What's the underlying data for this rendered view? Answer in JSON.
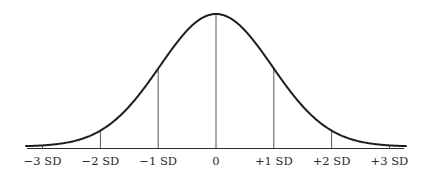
{
  "chart_data": {
    "type": "line",
    "title": "",
    "xlabel": "",
    "ylabel": "",
    "x_ticks": [
      -3,
      -2,
      -1,
      0,
      1,
      2,
      3
    ],
    "tick_labels": [
      "−3 SD",
      "−2 SD",
      "−1 SD",
      "0",
      "+1 SD",
      "+2 SD",
      "+3 SD"
    ],
    "series": [
      {
        "name": "normal density",
        "x": [
          -3.5,
          -3,
          -2,
          -1,
          0,
          1,
          2,
          3,
          3.5
        ],
        "values": [
          0.0022,
          0.0111,
          0.1353,
          0.6065,
          1.0,
          0.6065,
          0.1353,
          0.0111,
          0.0022
        ]
      }
    ],
    "xlim": [
      -3.3,
      3.3
    ],
    "ylim": [
      0,
      1
    ],
    "grid": false,
    "legend": null
  },
  "colors": {
    "curve": "#1e1e1e",
    "reference_lines": "#555555",
    "axis": "#2a2a2a",
    "text": "#2a2a2a"
  }
}
